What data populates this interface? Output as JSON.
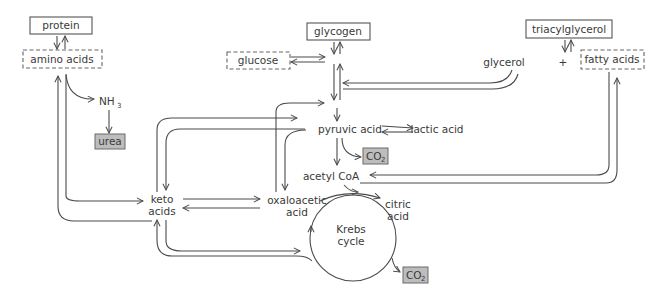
{
  "diagram": {
    "nodes": {
      "protein": "protein",
      "amino_acids": "amino acids",
      "nh3": "NH",
      "nh3_sub": "3",
      "urea": "urea",
      "glycogen": "glycogen",
      "glucose": "glucose",
      "triacylglycerol": "triacylglycerol",
      "glycerol": "glycerol",
      "plus": "+",
      "fatty_acids": "fatty acids",
      "pyruvic_acid": "pyruvic acid",
      "lactic_acid": "lactic acid",
      "co2_a": "CO",
      "co2_a_sub": "2",
      "acetyl_coa": "acetyl CoA",
      "keto_acids_l1": "keto",
      "keto_acids_l2": "acids",
      "oxaloacetic_l1": "oxaloacetic",
      "oxaloacetic_l2": "acid",
      "citric_l1": "citric",
      "citric_l2": "acid",
      "krebs_l1": "Krebs",
      "krebs_l2": "cycle",
      "co2_b": "CO",
      "co2_b_sub": "2"
    },
    "box_styles": {
      "solid": [
        "protein",
        "glycogen",
        "triacylglycerol"
      ],
      "dashed": [
        "amino acids",
        "glucose",
        "fatty acids"
      ],
      "shaded": [
        "urea",
        "CO2",
        "CO2"
      ]
    },
    "colors": {
      "line": "#4a4a4a",
      "text": "#3a3a3a",
      "shaded_box": "#bdbdbd"
    }
  }
}
